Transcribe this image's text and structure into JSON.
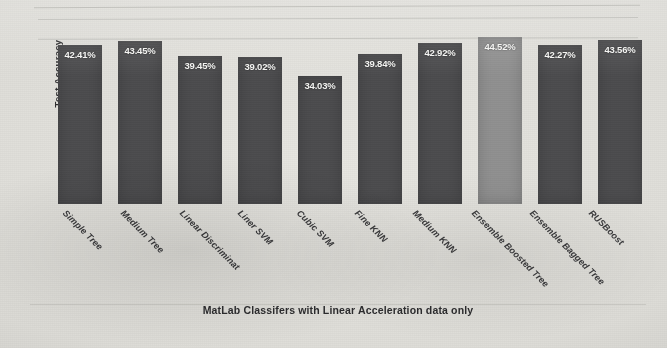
{
  "chart_data": {
    "type": "bar",
    "title": "",
    "xlabel": "MatLab Classifers with Linear Acceleration data only",
    "ylabel": "Test Accuracy",
    "categories": [
      "Simple Tree",
      "Medium Tree",
      "Linear Discriminat",
      "Liner SVM",
      "Cubic SVM",
      "Fine KNN",
      "Medium KNN",
      "Ensemble Boosted Tree",
      "Ensemble Bagged Tree",
      "RUSBoost"
    ],
    "values": [
      42.41,
      43.45,
      39.45,
      39.02,
      34.03,
      39.84,
      42.92,
      44.52,
      42.27,
      43.56
    ],
    "value_labels": [
      "42.41%",
      "43.45%",
      "39.45%",
      "39.02%",
      "34.03%",
      "39.84%",
      "42.92%",
      "44.52%",
      "42.27%",
      "43.56%"
    ],
    "ylim": [
      0,
      50
    ],
    "grid": true,
    "gridlines_visible": 2,
    "legend": "none",
    "bar_color": "#4c4c4e",
    "highlight_bar_index": 7,
    "highlight_bar_color": "#8f8f8f",
    "value_label_color": "#f2f2f0",
    "background_color": "#dcdbd6"
  }
}
